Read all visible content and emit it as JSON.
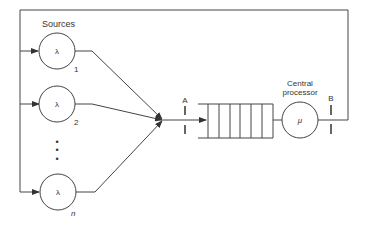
{
  "diagram": {
    "sources_label": "Sources",
    "sources": [
      {
        "symbol": "λ",
        "index": "1"
      },
      {
        "symbol": "λ",
        "index": "2"
      },
      {
        "symbol": "λ",
        "index": "n"
      }
    ],
    "ellipsis": "•",
    "marker_a": "A",
    "marker_b": "B",
    "processor_label_line1": "Central",
    "processor_label_line2": "processor",
    "processor_symbol": "μ",
    "queue_slots": 6,
    "colors": {
      "line": "#444444",
      "background": "#ffffff"
    }
  }
}
